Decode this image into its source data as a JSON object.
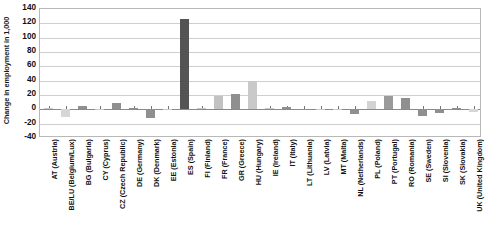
{
  "chart_data": {
    "type": "bar",
    "title": "",
    "xlabel": "",
    "ylabel": "Change in employment in 1,000",
    "ylim": [
      -40,
      140
    ],
    "ytick_values": [
      140,
      120,
      100,
      80,
      60,
      40,
      20,
      0,
      -20,
      -40
    ],
    "ytick_labels": [
      "140",
      "120",
      "100",
      "80",
      "60",
      "40",
      "20",
      "0",
      "-20",
      "-40"
    ],
    "grid": true,
    "legend": "none",
    "categories": [
      "AT (Austria)",
      "BE/LU (Belgium/Lux)",
      "BG (Bulgaria)",
      "CY (Cyprus)",
      "CZ (Czech Republic)",
      "DE (Germany)",
      "DK (Denmark)",
      "EE (Estonia)",
      "ES (Spain)",
      "FI (Finland)",
      "FR (France)",
      "GR (Greece)",
      "HU (Hungary)",
      "IE (Ireland)",
      "IT (Italy)",
      "LT (Lithuania)",
      "LV (Latvia)",
      "MT (Malta)",
      "NL (Netherlands)",
      "PL (Poland)",
      "PT (Portugal)",
      "RO (Romania)",
      "SE (Sweden)",
      "SI (Slovenia)",
      "SK (Slovakia)",
      "UK (United Kingdom)"
    ],
    "values": [
      1.5,
      -11.0,
      5.0,
      1.0,
      8.5,
      1.5,
      -12.0,
      0.5,
      126.0,
      2.0,
      19.0,
      21.0,
      39.0,
      2.0,
      3.0,
      1.0,
      1.0,
      0.5,
      -7.0,
      11.0,
      19.0,
      16.0,
      -9.5,
      -5.0,
      2.0,
      -4.0
    ],
    "bar_colors": [
      "#c9c9c9",
      "#d6d6d6",
      "#8f8f8f",
      "#c9c9c9",
      "#8f8f8f",
      "#8f8f8f",
      "#8f8f8f",
      "#c9c9c9",
      "#545454",
      "#c9c9c9",
      "#c2c2c2",
      "#8f8f8f",
      "#c9c9c9",
      "#c9c9c9",
      "#8f8f8f",
      "#8f8f8f",
      "#c9c9c9",
      "#c9c9c9",
      "#8f8f8f",
      "#d3d3d3",
      "#9a9a9a",
      "#8f8f8f",
      "#8f8f8f",
      "#8f8f8f",
      "#8f8f8f",
      "#d6d6d6"
    ],
    "axis_color": "#b8b8b8",
    "grid_color": "#cfcfcf",
    "zero_line_color": "#8a8a8a"
  }
}
